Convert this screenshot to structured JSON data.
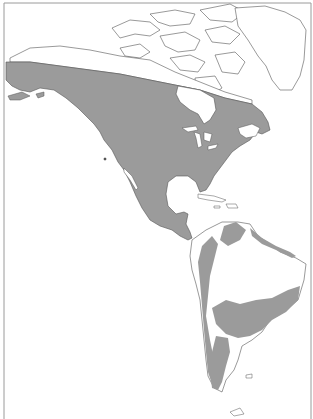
{
  "map": {
    "type": "range-map",
    "region": "The Americas",
    "colors": {
      "background": "#ffffff",
      "range_fill": "#9b9b9b",
      "coastline": "#555555",
      "border": "#9a9a9a"
    },
    "range_areas": [
      "North America south of diagonal line from Alaska to Labrador",
      "Mexico and Central America",
      "Northern South America (Venezuela/Colombia)",
      "Andes west coast",
      "Southern Brazil / Paraguay / Uruguay",
      "Southern Andes and Patagonia"
    ]
  }
}
